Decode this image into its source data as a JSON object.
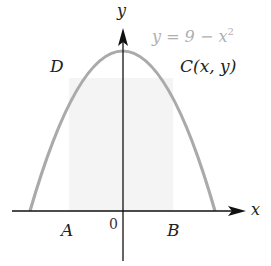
{
  "diagram": {
    "type": "inscribed-rectangle-under-parabola",
    "curve": {
      "equation_lhs": "y = 9 − x",
      "equation_exponent": "2",
      "color": "#aaaaaa"
    },
    "axes": {
      "x_label": "x",
      "y_label": "y",
      "origin_label": "0",
      "color": "#111111"
    },
    "rectangle": {
      "fill": "#f4f4f4"
    },
    "points": {
      "A": "A",
      "B": "B",
      "C": "C(x, y)",
      "D": "D"
    }
  }
}
